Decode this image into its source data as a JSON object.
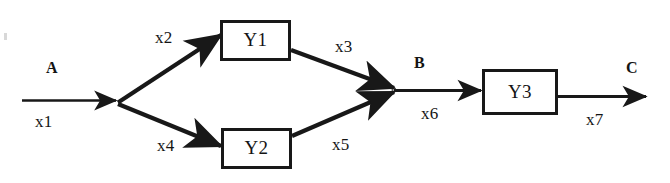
{
  "diagram": {
    "stroke_color": "#181818",
    "background_color": "#ffffff",
    "blocks": [
      {
        "id": "Y1",
        "label": "Y1"
      },
      {
        "id": "Y2",
        "label": "Y2"
      },
      {
        "id": "Y3",
        "label": "Y3"
      }
    ],
    "terminals": [
      {
        "id": "A",
        "label": "A"
      },
      {
        "id": "B",
        "label": "B"
      },
      {
        "id": "C",
        "label": "C"
      }
    ],
    "signals": [
      {
        "id": "x1",
        "label": "x1",
        "from": "A",
        "to": "fork"
      },
      {
        "id": "x2",
        "label": "x2",
        "from": "fork",
        "to": "Y1"
      },
      {
        "id": "x3",
        "label": "x3",
        "from": "Y1",
        "to": "merge"
      },
      {
        "id": "x4",
        "label": "x4",
        "from": "fork",
        "to": "Y2"
      },
      {
        "id": "x5",
        "label": "x5",
        "from": "Y2",
        "to": "merge"
      },
      {
        "id": "x6",
        "label": "x6",
        "from": "B",
        "to": "Y3"
      },
      {
        "id": "x7",
        "label": "x7",
        "from": "Y3",
        "to": "C"
      }
    ]
  }
}
